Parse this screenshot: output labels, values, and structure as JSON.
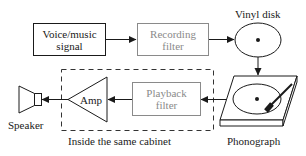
{
  "diagram": {
    "blocks": {
      "voice_signal": {
        "line1": "Voice/music",
        "line2": "signal"
      },
      "recording_filter": {
        "line1": "Recording",
        "line2": "filter"
      },
      "playback_filter": {
        "line1": "Playback",
        "line2": "filter"
      },
      "amp": {
        "label": "Amp"
      }
    },
    "labels": {
      "vinyl_disk": "Vinyl disk",
      "phonograph": "Phonograph",
      "speaker": "Speaker",
      "cabinet": "Inside the same cabinet"
    },
    "colors": {
      "primary_stroke": "#1a1a1a",
      "filter_stroke": "#8a8a8a",
      "background": "#ffffff"
    }
  }
}
